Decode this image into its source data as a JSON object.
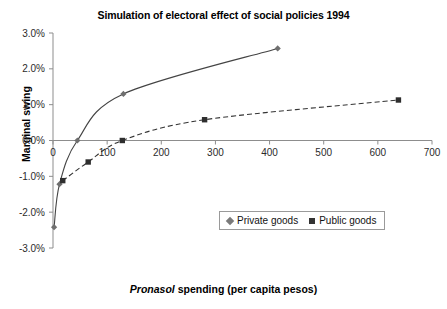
{
  "chart_data": {
    "type": "line",
    "title": "Simulation of electoral effect of social policies 1994",
    "xlabel": "Pronasol spending (per capita pesos)",
    "xlabel_italic_part": "Pronasol",
    "xlabel_rest": " spending (per capita pesos)",
    "ylabel": "Marginal swing",
    "xlim": [
      0,
      700
    ],
    "ylim": [
      -3.0,
      3.0
    ],
    "xticks": [
      0,
      100,
      200,
      300,
      400,
      500,
      600,
      700
    ],
    "xtick_labels": [
      "0",
      "100",
      "200",
      "300",
      "400",
      "500",
      "600",
      "700"
    ],
    "yticks": [
      -3.0,
      -2.0,
      -1.0,
      0.0,
      1.0,
      2.0,
      3.0
    ],
    "ytick_labels": [
      "-3.0%",
      "-2.0%",
      "-1.0%",
      "0.0%",
      "1.0%",
      "2.0%",
      "3.0%"
    ],
    "grid": false,
    "legend_position": "lower-center-right",
    "series": [
      {
        "name": "Private goods",
        "marker": "diamond",
        "linestyle": "solid",
        "color": "#444444",
        "points": [
          {
            "x": 2,
            "y": -2.42
          },
          {
            "x": 12,
            "y": -1.22
          },
          {
            "x": 45,
            "y": 0.0
          },
          {
            "x": 130,
            "y": 1.3
          },
          {
            "x": 415,
            "y": 2.57
          }
        ]
      },
      {
        "name": "Public goods",
        "marker": "square",
        "linestyle": "dashed",
        "color": "#333333",
        "points": [
          {
            "x": 18,
            "y": -1.12
          },
          {
            "x": 65,
            "y": -0.6
          },
          {
            "x": 128,
            "y": 0.0
          },
          {
            "x": 280,
            "y": 0.58
          },
          {
            "x": 638,
            "y": 1.13
          }
        ]
      }
    ],
    "legend": [
      {
        "label": "Private goods",
        "marker": "diamond"
      },
      {
        "label": "Public goods",
        "marker": "square"
      }
    ]
  }
}
